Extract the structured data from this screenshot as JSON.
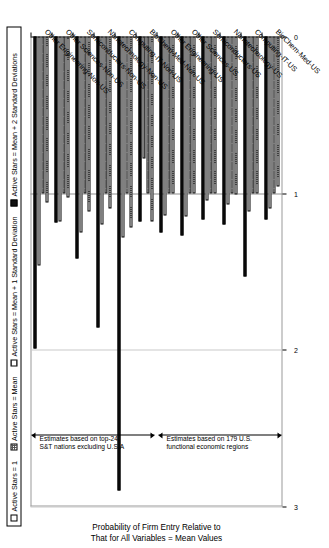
{
  "legend": {
    "items": [
      {
        "label": "Active Stars = 1",
        "pattern": "vertical-lines",
        "color": "#ffffff"
      },
      {
        "label": "Active Stars = Mean",
        "pattern": "checkered",
        "color": "#bfbfbf"
      },
      {
        "label": "Active Stars = Mean + 1 Standard Deviation",
        "pattern": "horizontal-lines",
        "color": "#ffffff"
      },
      {
        "label": "Active Stars = Mean + 2 Standard Deviations",
        "pattern": "solid",
        "color": "#111111"
      }
    ]
  },
  "annotations": [
    {
      "name": "us-regions-note",
      "text": "Estimates based on 179 U.S. functional economic regions"
    },
    {
      "name": "non-us-note",
      "text": "Estimates based on top-24 S&T nations excluding U.S.A"
    }
  ],
  "axis": {
    "value_title_line1": "Probability of Firm Entry Relative to",
    "value_title_line2": "That for All Variables = Mean Values",
    "ticks": [
      "0",
      "1",
      "2",
      "3"
    ]
  },
  "chart_data": {
    "type": "bar",
    "title": "",
    "xlabel": "",
    "ylabel": "Probability of Firm Entry Relative to That for All Variables = Mean Values",
    "ylim": [
      0,
      3
    ],
    "grid": true,
    "legend_position": "top",
    "orientation": "horizontal",
    "categories": [
      "BioChem-Med-US",
      "Computing-IT-US",
      "Nanotechnology-US",
      "Semiconductors-US",
      "Other Sciences-US",
      "Other Engineering-US",
      "BioChem-Med-Non-US",
      "Computing-IT-Non-US",
      "Nanotechnology-Non-US",
      "Semiconductors-Non-US",
      "Other Sciences-Non-US",
      "Other Engineering-Non-US"
    ],
    "series": [
      {
        "name": "Active Stars = 1",
        "pattern": "vertical-lines",
        "values": [
          0.96,
          1.0,
          1.01,
          1.0,
          1.0,
          1.0,
          1.18,
          1.22,
          1.1,
          1.12,
          1.03,
          1.06
        ]
      },
      {
        "name": "Active Stars = Mean",
        "pattern": "checkered",
        "values": [
          1.0,
          1.0,
          1.0,
          1.0,
          1.0,
          1.0,
          1.0,
          1.0,
          1.0,
          1.0,
          1.0,
          1.0
        ]
      },
      {
        "name": "Active Stars = Mean + 1 Standard Deviation",
        "pattern": "horizontal-lines",
        "values": [
          1.1,
          1.12,
          1.07,
          1.05,
          1.15,
          1.14,
          0.78,
          1.28,
          1.2,
          1.25,
          1.18,
          1.46
        ]
      },
      {
        "name": "Active Stars = Mean + 2 Standard Deviations",
        "pattern": "solid",
        "values": [
          1.17,
          1.53,
          1.2,
          1.17,
          1.27,
          1.25,
          1.18,
          2.9,
          1.86,
          1.42,
          1.19,
          1.99
        ]
      }
    ]
  }
}
